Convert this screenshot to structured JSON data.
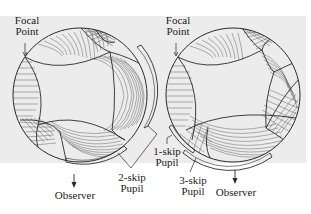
{
  "figure": {
    "background_color": "#ececec",
    "line_color": "#2a2a2a",
    "panels": [
      {
        "id": "left",
        "circle": {
          "cx": 80,
          "cy": 95,
          "r": 67
        },
        "labels": {
          "focal_point": "Focal\nPoint",
          "pupil": "2-skip\nPupil",
          "observer": "Observer"
        }
      },
      {
        "id": "right",
        "circle": {
          "cx": 233,
          "cy": 95,
          "r": 67
        },
        "labels": {
          "focal_point": "Focal\nPoint",
          "pupil_1": "1-skip\nPupil",
          "pupil_3": "3-skip\nPupil",
          "observer": "Observer"
        }
      }
    ]
  },
  "text": {
    "left_focal_line1": "Focal",
    "left_focal_line2": "Point",
    "left_pupil_line1": "2-skip",
    "left_pupil_line2": "Pupil",
    "left_observer": "Observer",
    "right_focal_line1": "Focal",
    "right_focal_line2": "Point",
    "right_pupil1_line1": "1-skip",
    "right_pupil1_line2": "Pupil",
    "right_pupil3_line1": "3-skip",
    "right_pupil3_line2": "Pupil",
    "right_observer": "Observer"
  }
}
